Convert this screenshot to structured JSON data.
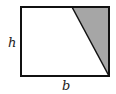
{
  "diagram": {
    "type": "geometry",
    "shape": "rectangle with shaded right triangle",
    "labels": {
      "height": "h",
      "base": "b"
    },
    "colors": {
      "stroke": "#111111",
      "shade": "#a6a6a6",
      "background": "#ffffff"
    },
    "rectangle": {
      "x": 21,
      "y": 7,
      "width": 88,
      "height": 69
    },
    "triangle": {
      "points": "72,7 109,7 109,76"
    }
  }
}
